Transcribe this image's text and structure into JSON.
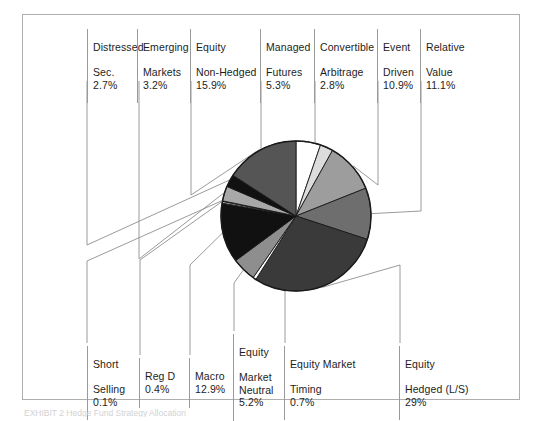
{
  "figure": {
    "border_color": "#aeaeae",
    "background": "#ffffff"
  },
  "caption": {
    "text": "EXHIBIT 2   Hedge Fund Strategy Allocation"
  },
  "chart_data": {
    "type": "pie",
    "title": "",
    "xlabel": "",
    "ylabel": "",
    "center": [
      273,
      201
    ],
    "radius": 75,
    "start_angle_deg": -90,
    "direction": "clockwise",
    "legend": "leader-line callouts",
    "grid": false,
    "categories": [
      "Managed Futures",
      "Convertible Arbitrage",
      "Event Driven",
      "Relative Value",
      "Equity Hedged (L/S)",
      "Equity Market Timing",
      "Equity Market Neutral",
      "Macro",
      "Reg D",
      "Short Selling",
      "Emerging Markets",
      "Distressed Sec.",
      "Equity Non-Hedged"
    ],
    "values": [
      5.3,
      2.8,
      10.9,
      11.1,
      29.0,
      0.7,
      5.2,
      12.9,
      0.4,
      0.1,
      3.2,
      2.7,
      15.9
    ],
    "value_labels": [
      "5.3%",
      "2.8%",
      "10.9%",
      "11.1%",
      "29%",
      "0.7%",
      "5.2%",
      "12.9%",
      "0.4%",
      "0.1%",
      "3.2%",
      "2.7%",
      "15.9%"
    ],
    "colors": [
      "#ffffff",
      "#dcdcdc",
      "#9d9d9d",
      "#6e6e6e",
      "#3a3a3a",
      "#ffffff",
      "#8e8e8e",
      "#111111",
      "#a8a8a8",
      "#ffffff",
      "#a8a8a8",
      "#111111",
      "#555555"
    ],
    "stroke": "#1a1a1a"
  },
  "labels": {
    "top": [
      {
        "name": "distressed-sec",
        "line1": "Distressed",
        "line2": "Sec.",
        "pct": "2.7%",
        "x": 86,
        "y": 14,
        "w": 60
      },
      {
        "name": "emerging-markets",
        "line1": "Emerging",
        "line2": "Markets",
        "pct": "3.2%",
        "x": 136,
        "y": 14,
        "w": 55
      },
      {
        "name": "equity-non-hedged",
        "line1": "Equity",
        "line2": "Non-Hedged",
        "pct": "15.9%",
        "x": 189,
        "y": 14,
        "w": 72
      },
      {
        "name": "managed-futures",
        "line1": "Managed",
        "line2": "Futures",
        "pct": "5.3%",
        "x": 259,
        "y": 14,
        "w": 56
      },
      {
        "name": "convertible-arbitrage",
        "line1": "Convertible",
        "line2": "Arbitrage",
        "pct": "2.8%",
        "x": 313,
        "y": 14,
        "w": 65
      },
      {
        "name": "event-driven",
        "line1": "Event",
        "line2": "Driven",
        "pct": "10.9%",
        "x": 376,
        "y": 14,
        "w": 45
      },
      {
        "name": "relative-value",
        "line1": "Relative",
        "line2": "Value",
        "pct": "11.1%",
        "x": 419,
        "y": 14,
        "w": 60
      }
    ],
    "bottom": [
      {
        "name": "short-selling",
        "line1": "Short",
        "line2": "Selling",
        "pct": "0.1%",
        "x": 86,
        "y": 345,
        "w": 52
      },
      {
        "name": "reg-d",
        "line1": "",
        "line2": "Reg D",
        "pct": "0.4%",
        "x": 138,
        "y": 345,
        "w": 50
      },
      {
        "name": "macro",
        "line1": "",
        "line2": "Macro",
        "pct": "12.9%",
        "x": 188,
        "y": 345,
        "w": 46
      },
      {
        "name": "equity-market-neutral",
        "line1": "Equity",
        "line2": "Market\nNeutral",
        "pct": "5.2%",
        "x": 232,
        "y": 333,
        "w": 52
      },
      {
        "name": "equity-market-timing",
        "line1": "Equity Market",
        "line2": "Timing",
        "pct": "0.7%",
        "x": 283,
        "y": 345,
        "w": 90
      },
      {
        "name": "equity-hedged-ls",
        "line1": "Equity",
        "line2": "Hedged (L/S)",
        "pct": "29%",
        "x": 398,
        "y": 345,
        "w": 80
      }
    ]
  }
}
